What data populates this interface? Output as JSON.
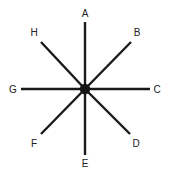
{
  "diagram": {
    "type": "radial-spoke-star",
    "title": "",
    "canvas": {
      "width": 170,
      "height": 179,
      "background": "#ffffff"
    },
    "colors": {
      "line": "#1a1a1a",
      "hub": "#141414",
      "label": "#222222",
      "background": "#ffffff"
    },
    "hub": {
      "name": "center-node",
      "cx": 85,
      "cy": 89,
      "r": 5.2
    },
    "style": {
      "line_width": 2.4,
      "label_font_size": 10
    },
    "spokes": [
      {
        "label": "A",
        "angle_deg": 90,
        "direction": "up",
        "x1": 85,
        "y1": 89,
        "x2": 85,
        "y2": 22,
        "label_x": 85,
        "label_y": 14
      },
      {
        "label": "B",
        "angle_deg": 45,
        "direction": "up-right",
        "x1": 85,
        "y1": 89,
        "x2": 131,
        "y2": 42,
        "label_x": 137,
        "label_y": 33
      },
      {
        "label": "C",
        "angle_deg": 0,
        "direction": "right",
        "x1": 85,
        "y1": 89,
        "x2": 150,
        "y2": 89,
        "label_x": 157,
        "label_y": 90
      },
      {
        "label": "D",
        "angle_deg": -45,
        "direction": "down-right",
        "x1": 85,
        "y1": 89,
        "x2": 130,
        "y2": 134,
        "label_x": 136,
        "label_y": 144
      },
      {
        "label": "E",
        "angle_deg": -90,
        "direction": "down",
        "x1": 85,
        "y1": 89,
        "x2": 85,
        "y2": 155,
        "label_x": 85,
        "label_y": 164
      },
      {
        "label": "F",
        "angle_deg": -135,
        "direction": "down-left",
        "x1": 85,
        "y1": 89,
        "x2": 41,
        "y2": 134,
        "label_x": 34,
        "label_y": 144
      },
      {
        "label": "G",
        "angle_deg": 180,
        "direction": "left",
        "x1": 85,
        "y1": 89,
        "x2": 21,
        "y2": 89,
        "label_x": 13,
        "label_y": 90
      },
      {
        "label": "H",
        "angle_deg": 135,
        "direction": "up-left",
        "x1": 85,
        "y1": 89,
        "x2": 41,
        "y2": 42,
        "label_x": 34,
        "label_y": 33
      }
    ]
  }
}
